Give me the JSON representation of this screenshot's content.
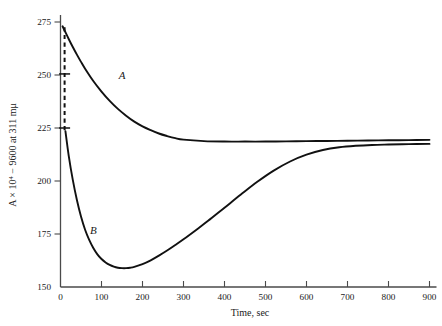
{
  "chart_data": {
    "type": "line",
    "title": "",
    "xlabel": "Time, sec",
    "ylabel": "A × 10⁴ − 9600 at 311 mμ",
    "ylabel_parts": {
      "lead": "A × 10",
      "exponent": "4",
      "tail": " − 9600 at 311 mμ"
    },
    "xlim": [
      0,
      900
    ],
    "ylim": [
      150,
      275
    ],
    "xticks": [
      0,
      100,
      200,
      300,
      400,
      500,
      600,
      700,
      800,
      900
    ],
    "xticklabels": [
      "0",
      "100",
      "200",
      "300",
      "400",
      "500",
      "600",
      "700",
      "800",
      "900"
    ],
    "yticks": [
      150,
      175,
      200,
      225,
      250,
      275
    ],
    "yticklabels": [
      "150",
      "175",
      "200",
      "225",
      "250",
      "275"
    ],
    "grid": false,
    "legend": "none",
    "line_color": "#111111",
    "axis_color": "#4a4a4a",
    "background": "#ffffff",
    "series": [
      {
        "name": "A",
        "label": "A",
        "label_x": 150,
        "label_y": 248,
        "style": "solid",
        "x": [
          5,
          10,
          20,
          30,
          40,
          50,
          60,
          80,
          100,
          120,
          140,
          160,
          180,
          200,
          220,
          240,
          260,
          280,
          300,
          350,
          400,
          450,
          500,
          550,
          600,
          650,
          700,
          750,
          800,
          850,
          900
        ],
        "y": [
          273.0,
          271.0,
          267.0,
          263.2,
          259.6,
          256.2,
          253.0,
          247.2,
          242.2,
          237.8,
          234.0,
          230.8,
          228.0,
          225.8,
          224.0,
          222.4,
          221.2,
          220.2,
          219.5,
          218.8,
          218.6,
          218.6,
          218.6,
          218.7,
          218.8,
          218.9,
          219.0,
          219.1,
          219.2,
          219.3,
          219.4
        ]
      },
      {
        "name": "B",
        "label": "B",
        "label_x": 80,
        "label_y": 175,
        "style": "solid",
        "x": [
          12,
          20,
          30,
          40,
          50,
          60,
          70,
          80,
          90,
          100,
          110,
          120,
          130,
          140,
          150,
          160,
          170,
          180,
          200,
          220,
          240,
          260,
          280,
          300,
          330,
          360,
          400,
          440,
          480,
          520,
          560,
          600,
          640,
          680,
          720,
          760,
          800,
          850,
          900
        ],
        "y": [
          223.5,
          212.0,
          200.5,
          191.0,
          183.2,
          177.0,
          172.2,
          168.4,
          165.4,
          163.2,
          161.6,
          160.4,
          159.6,
          159.1,
          158.9,
          158.9,
          159.1,
          159.5,
          160.8,
          162.6,
          164.8,
          167.2,
          169.8,
          172.5,
          176.8,
          181.2,
          187.4,
          193.6,
          199.6,
          204.9,
          209.2,
          212.4,
          214.6,
          215.9,
          216.6,
          217.0,
          217.2,
          217.4,
          217.5
        ]
      }
    ],
    "annotations": [
      {
        "name": "dashed-uncertainty-bar",
        "style": "dashed-vertical",
        "x": 10,
        "y_top": 272.5,
        "y_bottom": 223.5,
        "caps": [
          250.5,
          225.0
        ]
      }
    ]
  }
}
